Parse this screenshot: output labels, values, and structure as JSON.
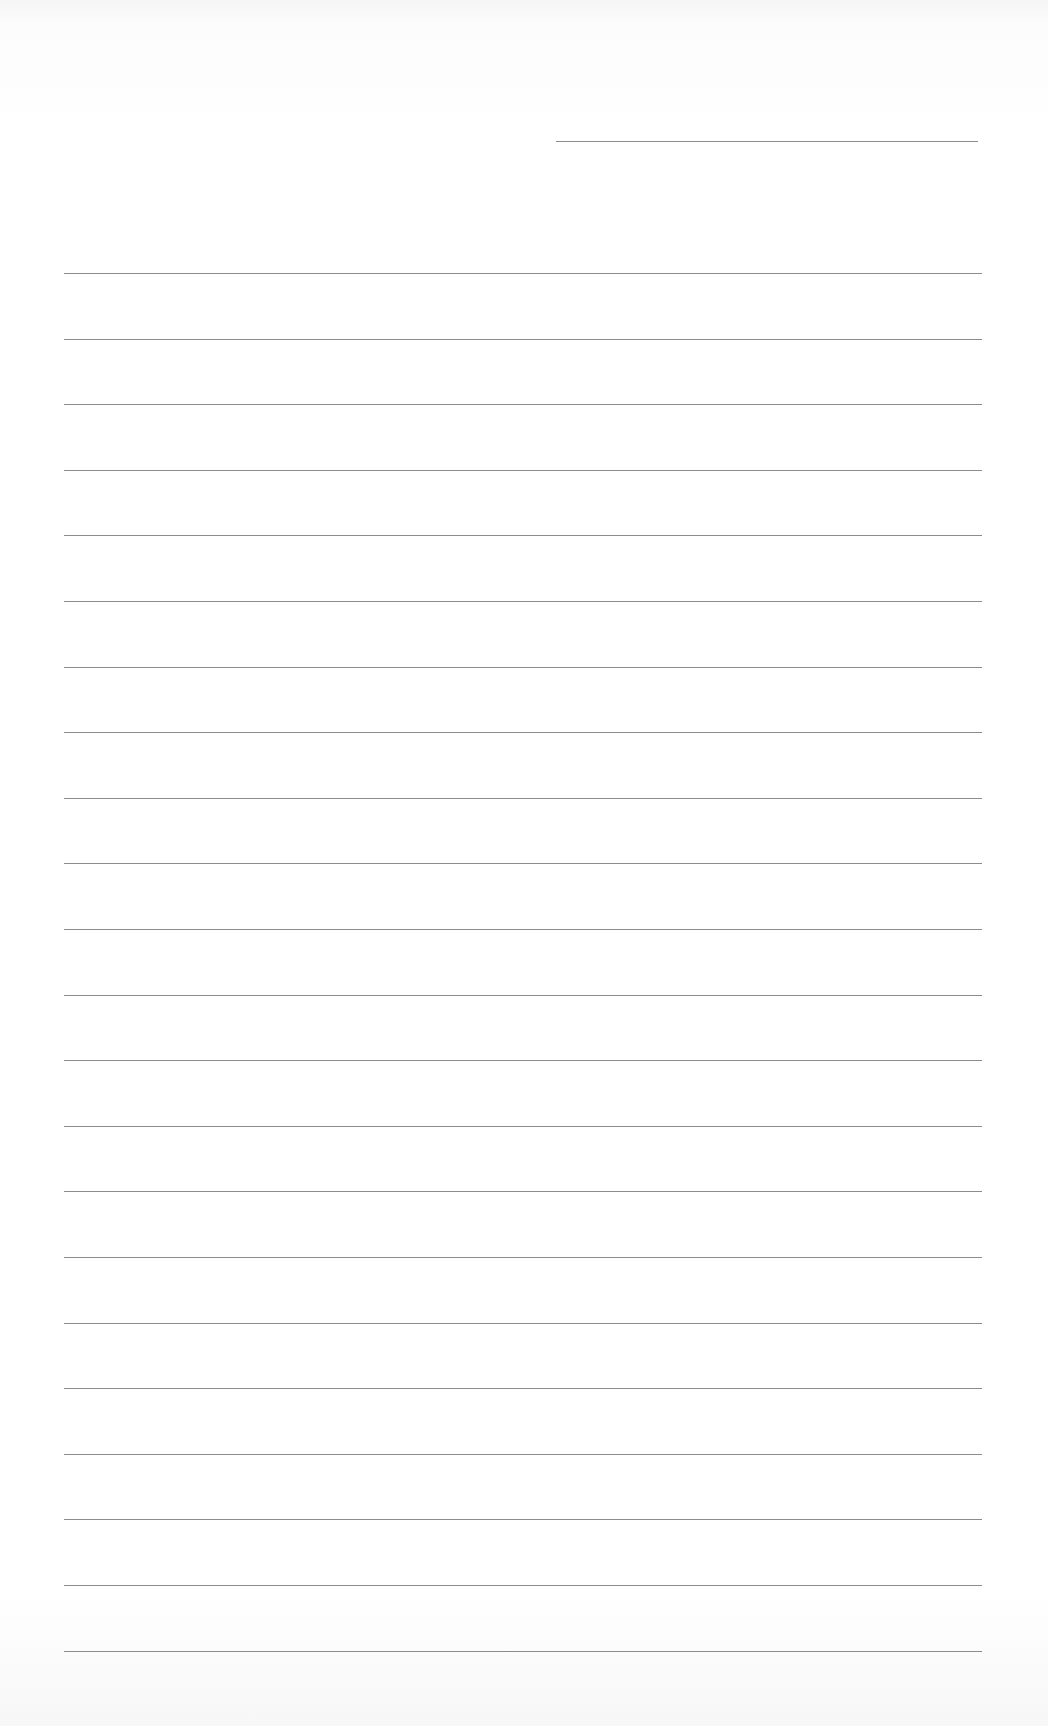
{
  "page": {
    "type": "lined-paper",
    "background_color": "#ffffff",
    "line_color": "#8c8c8c",
    "date_line": {
      "left": 556,
      "top": 141,
      "width": 422
    },
    "rules": {
      "count": 22,
      "left": 64,
      "width": 918,
      "first_top": 273,
      "spacing": 65.6
    },
    "text_content": []
  }
}
